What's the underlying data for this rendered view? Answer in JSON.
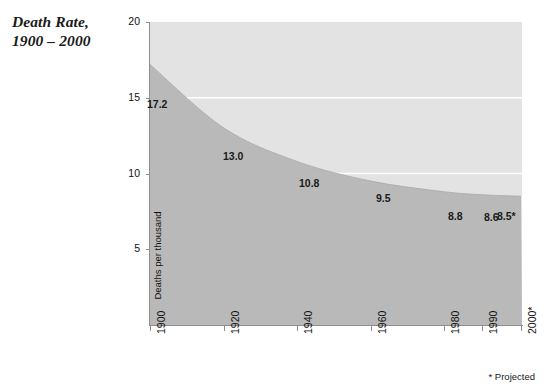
{
  "title": "Death Rate,\n1900 – 2000",
  "footnote": "* Projected",
  "colors": {
    "upper_fill": "#e3e3e3",
    "lower_fill": "#b9b9b9",
    "gridline": "#ffffff",
    "axis": "#8e8e8e",
    "text": "#111111"
  },
  "chart_data": {
    "type": "area",
    "xlabel": "",
    "ylabel": "Deaths per thousand",
    "categories": [
      "1900",
      "1920",
      "1940",
      "1960",
      "1980",
      "1990",
      "2000*"
    ],
    "x": [
      1900,
      1920,
      1940,
      1960,
      1980,
      1990,
      2000
    ],
    "values": [
      17.2,
      13.0,
      10.8,
      9.5,
      8.8,
      8.6,
      8.5
    ],
    "point_labels": [
      "17.2",
      "13.0",
      "10.8",
      "9.5",
      "8.8",
      "8.6",
      "8.5*"
    ],
    "ylim": [
      0,
      20
    ],
    "yticks": [
      5,
      10,
      15,
      20
    ],
    "ytick_labels": [
      "5",
      "10",
      "15",
      "20"
    ],
    "gridlines": [
      10,
      15
    ],
    "grid": true,
    "legend": null,
    "annotations": [
      "* Projected"
    ]
  },
  "y_axis": {
    "title": "Deaths per thousand",
    "ticks": [
      {
        "label": "20",
        "value": 20
      },
      {
        "label": "15",
        "value": 15
      },
      {
        "label": "10",
        "value": 10
      },
      {
        "label": "5",
        "value": 5
      }
    ]
  },
  "x_axis": {
    "ticks": [
      {
        "label": "1900",
        "value": 1900
      },
      {
        "label": "1920",
        "value": 1920
      },
      {
        "label": "1940",
        "value": 1940
      },
      {
        "label": "1960",
        "value": 1960
      },
      {
        "label": "1980",
        "value": 1980
      },
      {
        "label": "1990",
        "value": 1990
      },
      {
        "label": "2000*",
        "value": 2000
      }
    ]
  }
}
